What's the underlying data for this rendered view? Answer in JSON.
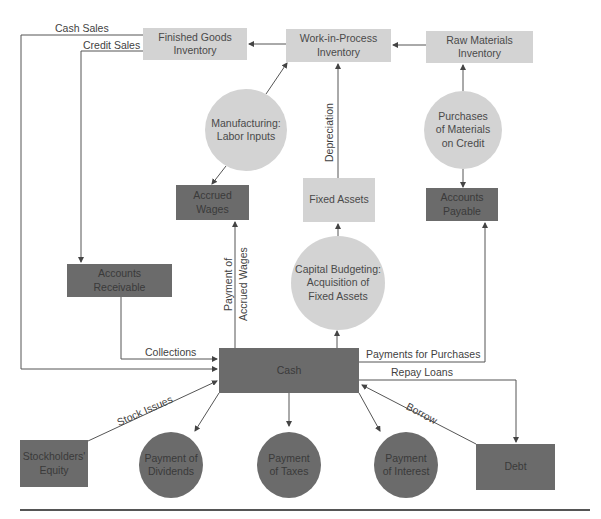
{
  "diagram": {
    "nodes": {
      "finished_goods": "Finished Goods\nInventory",
      "wip": "Work-in-Process\nInventory",
      "raw_materials": "Raw Materials\nInventory",
      "manufacturing": "Manufacturing:\nLabor Inputs",
      "purchases": "Purchases\nof Materials\non Credit",
      "accrued_wages": "Accrued\nWages",
      "fixed_assets": "Fixed Assets",
      "accounts_payable": "Accounts\nPayable",
      "accounts_receivable": "Accounts\nReceivable",
      "capital_budgeting": "Capital Budgeting:\nAcquisition of\nFixed Assets",
      "cash": "Cash",
      "stockholders_equity": "Stockholders'\nEquity",
      "dividends": "Payment of\nDividends",
      "taxes": "Payment\nof Taxes",
      "interest": "Payment\nof Interest",
      "debt": "Debt"
    },
    "edge_labels": {
      "cash_sales": "Cash Sales",
      "credit_sales": "Credit Sales",
      "depreciation": "Depreciation",
      "payment_accrued_wages_1": "Payment of",
      "payment_accrued_wages_2": "Accrued Wages",
      "collections": "Collections",
      "payments_for_purchases": "Payments for Purchases",
      "repay_loans": "Repay Loans",
      "borrow": "Borrow",
      "stock_issues": "Stock Issues"
    },
    "colors": {
      "light_node": "#d3d3d3",
      "dark_node": "#6b6b6b",
      "line": "#555555"
    }
  }
}
